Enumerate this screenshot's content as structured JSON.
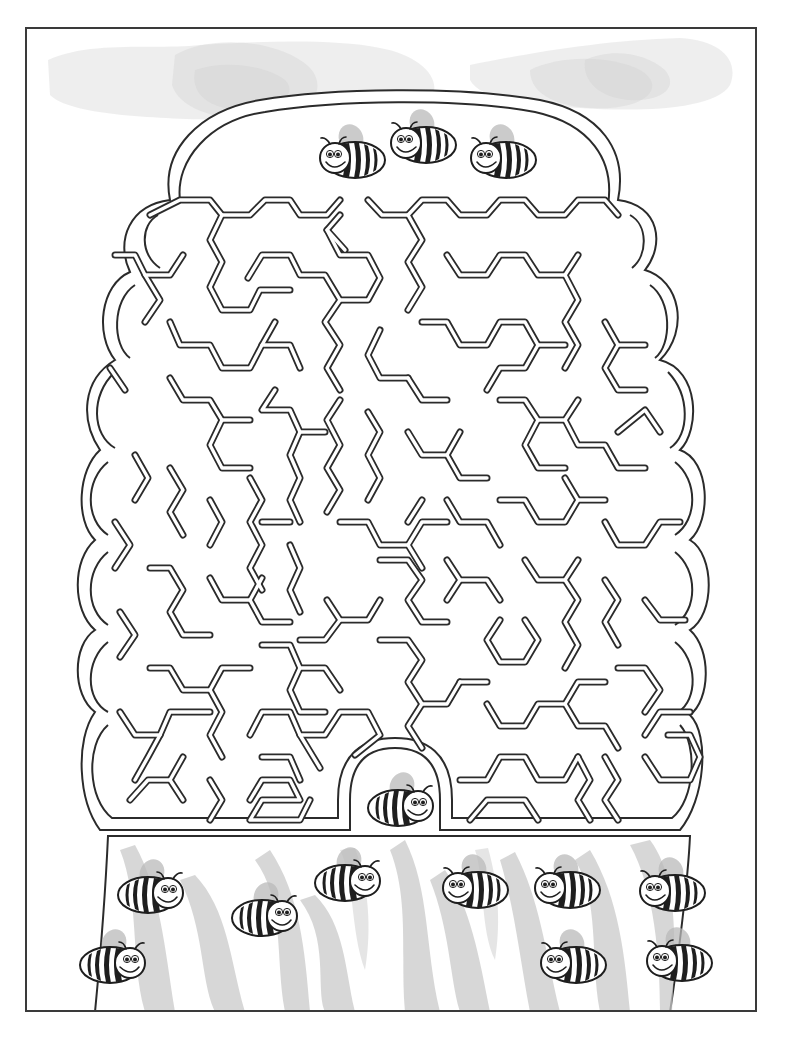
{
  "worksheet": {
    "title": "",
    "type": "maze",
    "theme": "bee hive",
    "colors": {
      "line": "#2b2b2b",
      "background": "#ffffff",
      "shading": "#c9c9c9",
      "bee_stripe": "#1e1e1e"
    }
  },
  "bees": [
    {
      "id": "top-left",
      "x": 355,
      "y": 160,
      "facing": "left",
      "zone": "hive-top"
    },
    {
      "id": "top-center",
      "x": 426,
      "y": 145,
      "facing": "left",
      "zone": "hive-top"
    },
    {
      "id": "top-right",
      "x": 506,
      "y": 160,
      "facing": "left",
      "zone": "hive-top"
    },
    {
      "id": "entrance",
      "x": 398,
      "y": 808,
      "facing": "right",
      "zone": "maze-exit"
    },
    {
      "id": "trunk-1",
      "x": 148,
      "y": 895,
      "facing": "right",
      "zone": "outside"
    },
    {
      "id": "trunk-2",
      "x": 262,
      "y": 918,
      "facing": "right",
      "zone": "outside"
    },
    {
      "id": "trunk-3",
      "x": 345,
      "y": 883,
      "facing": "right",
      "zone": "outside"
    },
    {
      "id": "trunk-4",
      "x": 478,
      "y": 890,
      "facing": "left",
      "zone": "outside"
    },
    {
      "id": "trunk-5",
      "x": 570,
      "y": 890,
      "facing": "left",
      "zone": "outside"
    },
    {
      "id": "trunk-6",
      "x": 675,
      "y": 893,
      "facing": "left",
      "zone": "outside"
    },
    {
      "id": "trunk-7",
      "x": 110,
      "y": 965,
      "facing": "right",
      "zone": "outside"
    },
    {
      "id": "trunk-8",
      "x": 576,
      "y": 965,
      "facing": "left",
      "zone": "outside"
    },
    {
      "id": "trunk-9",
      "x": 682,
      "y": 963,
      "facing": "left",
      "zone": "outside"
    }
  ],
  "maze": {
    "entrance_label": "",
    "exit_label": "",
    "walls": [
      "M150,215 L180,200 L210,200 L222,215 L250,215 L265,200 L290,200 L300,215 L327,215 L340,200",
      "M368,200 L382,215 L408,215 L422,200 L447,200 L460,215 L487,215 L500,200 L525,200 L538,215 L565,215 L578,200 L605,200 L618,215",
      "M222,215 L210,240 L222,262 L210,287 L222,310 L250,310 L260,290 L290,290",
      "M248,278 L262,255 L290,255 L300,275 L325,275 L340,300 L368,300 L380,278 L368,255 L340,255 L327,230 L340,215",
      "M327,230 L345,250",
      "M408,215 L422,240 L408,262 L422,287 L408,310",
      "M447,255 L460,275 L487,275 L500,255 L525,255 L538,275 L565,275 L578,255",
      "M565,275 L578,300 L565,322 L578,345 L565,368",
      "M115,255 L135,255 L145,275 L170,275 L183,255",
      "M145,275 L160,300 L145,322",
      "M170,322 L180,345 L210,345 L222,368 L250,368 L262,345 L290,345 L300,368",
      "M262,345 L275,322",
      "M340,300 L325,322 L340,345 L327,368 L340,390",
      "M380,330 L368,355 L380,378 L408,378",
      "M422,322 L447,322 L460,345 L487,345 L500,322 L525,322 L538,345 L525,368 L500,368 L487,390",
      "M408,378 L422,400 L447,400",
      "M538,345 L565,345",
      "M605,322 L618,345 L645,345",
      "M618,345 L605,368 L618,390 L645,390",
      "M110,368 L125,390",
      "M170,378 L183,400 L210,400 L222,420",
      "M222,420 L210,445 L222,468 L250,468",
      "M222,420 L250,420",
      "M275,390 L262,410 L290,410 L300,432 L325,432",
      "M300,432 L290,455 L300,478 L290,500 L300,522",
      "M340,400 L327,420 L340,445 L327,468 L340,490 L327,512",
      "M368,412 L380,432 L368,455 L380,478 L368,500",
      "M408,432 L422,455 L447,455 L460,432",
      "M447,455 L460,478 L487,478",
      "M500,400 L525,400 L538,420 L565,420 L578,400",
      "M538,420 L525,445 L538,468 L565,468",
      "M565,420 L578,445 L605,445 L618,468 L645,468",
      "M618,432 L645,410 L660,432",
      "M135,455 L148,478 L135,500",
      "M170,468 L183,490 L170,512 L183,535",
      "M210,500 L222,522 L210,545",
      "M250,478 L262,500 L250,522 L262,545 L250,568 L262,590",
      "M262,522 L290,522",
      "M290,545 L300,568 L290,590 L300,612",
      "M340,522 L368,522 L380,545 L408,545 L422,568",
      "M422,500 L408,522",
      "M408,545 L422,522 L447,522",
      "M447,500 L460,522 L487,522 L500,545",
      "M500,500 L525,500 L538,522 L565,522 L578,500 L605,500",
      "M578,500 L565,478",
      "M605,522 L618,545 L645,545 L660,522 L680,522",
      "M115,522 L130,545 L115,568",
      "M150,568 L170,568 L183,590 L170,612 L183,635 L210,635",
      "M210,578 L222,600 L250,600 L262,622 L290,622",
      "M250,600 L262,578",
      "M300,640 L325,640 L340,620 L368,620 L380,600",
      "M340,620 L327,600",
      "M380,560 L408,560 L422,580 L408,600 L422,622 L447,622",
      "M447,560 L460,580 L487,580 L500,600",
      "M460,580 L447,600",
      "M500,620 L487,640 L500,662 L525,662 L538,640 L525,620",
      "M525,560 L538,580 L565,580 L578,560",
      "M565,580 L578,600 L565,622 L578,645 L565,668",
      "M605,580 L618,600 L605,622 L618,645",
      "M645,600 L660,620 L685,620",
      "M120,612 L135,635 L120,657",
      "M150,668 L170,668 L183,690 L210,690 L222,668 L250,668",
      "M210,690 L222,712 L210,735 L222,757",
      "M262,645 L290,645 L300,668 L325,668 L340,690",
      "M300,668 L290,690 L300,712 L325,712",
      "M380,640 L408,640 L422,660 L408,682 L422,704 L447,704 L460,682",
      "M422,704 L408,726 L422,748",
      "M460,682 L487,682",
      "M487,704 L500,726 L525,726 L538,704 L565,704 L578,682 L605,682",
      "M565,704 L578,726 L605,726 L618,748",
      "M618,668 L645,668 L660,690 L645,712",
      "M120,712 L135,735 L160,735 L170,712 L210,712",
      "M160,735 L148,757 L135,780",
      "M250,735 L262,712 L290,712 L300,735 L325,735 L340,712 L368,712 L380,735 L355,755",
      "M300,735 L320,768",
      "M130,800 L148,780 L170,780 L183,800",
      "M183,757 L170,780",
      "M210,780 L222,800 L210,820",
      "M250,800 L262,780 L290,780 L300,800 L262,800 L250,820 L300,820 L310,800",
      "M262,757 L290,757 L300,780",
      "M460,780 L487,780 L500,757 L525,757 L538,780 L565,780 L578,757",
      "M470,820 L487,800 L525,800 L538,820",
      "M578,757 L590,780 L578,800 L590,820",
      "M605,757 L618,780 L605,800 L618,820",
      "M645,757 L660,780 L690,780 L700,757 L690,735 L668,735",
      "M645,735 L660,712 L690,712"
    ]
  }
}
